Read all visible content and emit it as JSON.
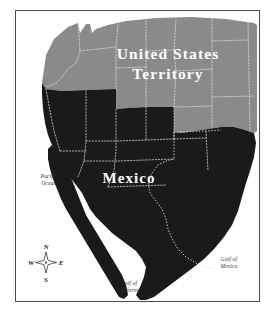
{
  "map": {
    "frame": {
      "border_color": "#4a4a4a",
      "background": "#ffffff"
    },
    "regions": [
      {
        "id": "united-states-territory",
        "label_line1": "United States",
        "label_line2": "Territory",
        "fill": "#8a8a8a",
        "label_color": "#ffffff"
      },
      {
        "id": "mexico",
        "label": "Mexico",
        "fill": "#1a1a1a",
        "label_color": "#ffffff"
      }
    ],
    "water_labels": [
      {
        "id": "pacific-ocean",
        "line1": "Pacific",
        "line2": "Ocean"
      },
      {
        "id": "gulf-of-california",
        "line1": "Gulf of",
        "line2": "California"
      },
      {
        "id": "gulf-of-mexico",
        "line1": "Gulf of",
        "line2": "Mexico"
      }
    ],
    "compass": {
      "north": "N",
      "south": "S",
      "east": "E",
      "west": "W",
      "star_fill": "#ffffff",
      "star_stroke": "#1a1a1a"
    },
    "border_style": {
      "internal_border_color": "#cfcfcf",
      "internal_border_dash": "1.5 1.6"
    }
  }
}
